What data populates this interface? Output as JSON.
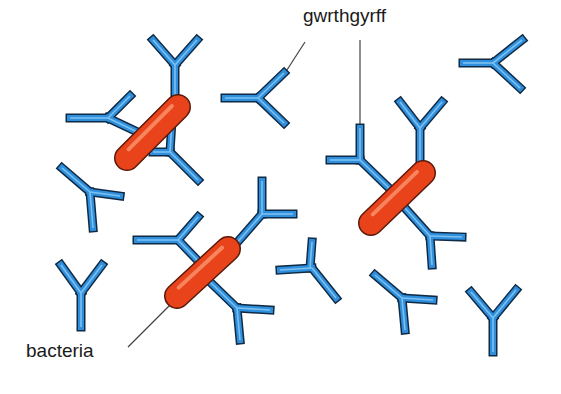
{
  "diagram": {
    "labels": {
      "antibodies": "gwrthgyrff",
      "bacteria": "bacteria"
    },
    "colors": {
      "antibody_fill": "#2f8fdc",
      "antibody_highlight": "#7cc0f0",
      "antibody_outline": "#0f2a45",
      "bacteria_fill": "#e8431a",
      "bacteria_highlight": "#f7845c",
      "bacteria_outline": "#5a1a0a",
      "leader_line": "#444444"
    },
    "bacteria": [
      {
        "id": "b1",
        "x1": 127,
        "y1": 158,
        "x2": 178,
        "y2": 107
      },
      {
        "id": "b2",
        "x1": 177,
        "y1": 296,
        "x2": 228,
        "y2": 249
      },
      {
        "id": "b3",
        "x1": 371,
        "y1": 223,
        "x2": 423,
        "y2": 173
      }
    ],
    "antibodies": [
      {
        "id": "a1",
        "stem": [
          [
            175,
            115
          ],
          [
            175,
            65
          ]
        ],
        "arm1": [
          [
            175,
            65
          ],
          [
            153,
            40
          ]
        ],
        "arm2": [
          [
            175,
            65
          ],
          [
            197,
            40
          ]
        ]
      },
      {
        "id": "a2",
        "stem": [
          [
            150,
            138
          ],
          [
            108,
            118
          ]
        ],
        "arm1": [
          [
            108,
            118
          ],
          [
            70,
            118
          ]
        ],
        "arm2": [
          [
            108,
            118
          ],
          [
            130,
            96
          ]
        ]
      },
      {
        "id": "a3",
        "stem": [
          [
            153,
            152
          ],
          [
            170,
            152
          ]
        ],
        "arm1": [
          [
            170,
            152
          ],
          [
            198,
            180
          ]
        ],
        "arm2": [
          [
            170,
            152
          ],
          [
            172,
            120
          ]
        ]
      },
      {
        "id": "a4",
        "stem": [
          [
            225,
            98
          ],
          [
            258,
            98
          ]
        ],
        "arm1": [
          [
            258,
            98
          ],
          [
            284,
            73
          ]
        ],
        "arm2": [
          [
            258,
            98
          ],
          [
            284,
            123
          ]
        ]
      },
      {
        "id": "a5",
        "stem": [
          [
            463,
            63
          ],
          [
            493,
            63
          ]
        ],
        "arm1": [
          [
            493,
            63
          ],
          [
            522,
            40
          ]
        ],
        "arm2": [
          [
            493,
            63
          ],
          [
            520,
            88
          ]
        ]
      },
      {
        "id": "a6",
        "stem": [
          [
            93,
            228
          ],
          [
            90,
            192
          ]
        ],
        "arm1": [
          [
            90,
            192
          ],
          [
            62,
            168
          ]
        ],
        "arm2": [
          [
            90,
            192
          ],
          [
            120,
            196
          ]
        ]
      },
      {
        "id": "a7",
        "stem": [
          [
            81,
            327
          ],
          [
            81,
            293
          ]
        ],
        "arm1": [
          [
            81,
            293
          ],
          [
            61,
            265
          ]
        ],
        "arm2": [
          [
            81,
            293
          ],
          [
            102,
            265
          ]
        ]
      },
      {
        "id": "a8",
        "stem": [
          [
            200,
            263
          ],
          [
            178,
            240
          ]
        ],
        "arm1": [
          [
            178,
            240
          ],
          [
            137,
            240
          ]
        ],
        "arm2": [
          [
            178,
            240
          ],
          [
            198,
            217
          ]
        ]
      },
      {
        "id": "a9",
        "stem": [
          [
            235,
            245
          ],
          [
            262,
            214
          ]
        ],
        "arm1": [
          [
            262,
            214
          ],
          [
            262,
            181
          ]
        ],
        "arm2": [
          [
            262,
            214
          ],
          [
            293,
            214
          ]
        ]
      },
      {
        "id": "a10",
        "stem": [
          [
            210,
            282
          ],
          [
            237,
            308
          ]
        ],
        "arm1": [
          [
            237,
            308
          ],
          [
            240,
            340
          ]
        ],
        "arm2": [
          [
            237,
            308
          ],
          [
            270,
            310
          ]
        ]
      },
      {
        "id": "a11",
        "stem": [
          [
            310,
            268
          ],
          [
            312,
            242
          ]
        ],
        "arm1": [
          [
            312,
            268
          ],
          [
            280,
            270
          ]
        ],
        "arm2": [
          [
            312,
            268
          ],
          [
            336,
            298
          ]
        ]
      },
      {
        "id": "a12",
        "stem": [
          [
            389,
            188
          ],
          [
            360,
            160
          ]
        ],
        "arm1": [
          [
            360,
            160
          ],
          [
            330,
            160
          ]
        ],
        "arm2": [
          [
            360,
            160
          ],
          [
            360,
            128
          ]
        ]
      },
      {
        "id": "a13",
        "stem": [
          [
            420,
            165
          ],
          [
            420,
            128
          ]
        ],
        "arm1": [
          [
            420,
            128
          ],
          [
            400,
            102
          ]
        ],
        "arm2": [
          [
            420,
            128
          ],
          [
            442,
            102
          ]
        ]
      },
      {
        "id": "a14",
        "stem": [
          [
            405,
            208
          ],
          [
            430,
            236
          ]
        ],
        "arm1": [
          [
            430,
            236
          ],
          [
            432,
            265
          ]
        ],
        "arm2": [
          [
            430,
            236
          ],
          [
            462,
            237
          ]
        ]
      },
      {
        "id": "a15",
        "stem": [
          [
            405,
            330
          ],
          [
            402,
            298
          ]
        ],
        "arm1": [
          [
            402,
            298
          ],
          [
            375,
            275
          ]
        ],
        "arm2": [
          [
            402,
            298
          ],
          [
            433,
            300
          ]
        ]
      },
      {
        "id": "a16",
        "stem": [
          [
            493,
            352
          ],
          [
            493,
            318
          ]
        ],
        "arm1": [
          [
            493,
            318
          ],
          [
            471,
            292
          ]
        ],
        "arm2": [
          [
            493,
            318
          ],
          [
            516,
            290
          ]
        ]
      }
    ],
    "leader_lines": [
      {
        "id": "to-antibody-a4",
        "x1": 305,
        "y1": 42,
        "x2": 285,
        "y2": 73
      },
      {
        "id": "to-antibody-a12",
        "x1": 360,
        "y1": 40,
        "x2": 360,
        "y2": 128
      },
      {
        "id": "to-bacteria-b2",
        "x1": 128,
        "y1": 347,
        "x2": 178,
        "y2": 297
      }
    ]
  }
}
